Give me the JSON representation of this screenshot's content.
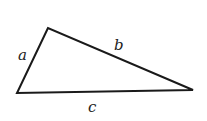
{
  "diagram": {
    "type": "triangle",
    "vertices": {
      "top": [
        48,
        28
      ],
      "bottom_left": [
        17,
        93
      ],
      "right": [
        193,
        90
      ]
    },
    "sides": [
      {
        "name": "a",
        "label": "a",
        "from": "bottom_left",
        "to": "top"
      },
      {
        "name": "b",
        "label": "b",
        "from": "top",
        "to": "right"
      },
      {
        "name": "c",
        "label": "c",
        "from": "bottom_left",
        "to": "right"
      }
    ],
    "stroke_color": "#1a1a1a",
    "label_color": "#222222"
  }
}
